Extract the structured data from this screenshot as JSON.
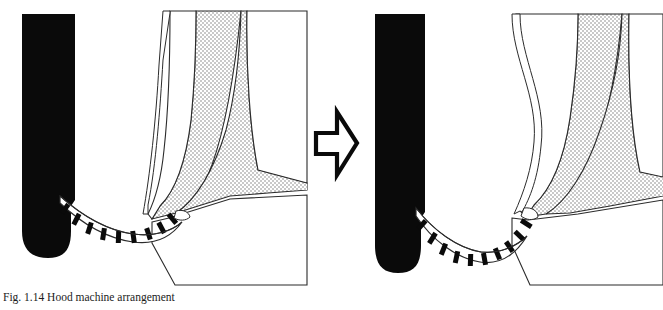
{
  "figure": {
    "caption": "Fig. 1.14 Hood machine arrangement",
    "panels": [
      {
        "id": "before",
        "name": "left-panel",
        "label": "",
        "roll_name": "suction-roll",
        "roll_color": "#0a0a0a",
        "felt_name": "forming-fabric-belt",
        "stipple_name": "stippled-nozzle-region"
      },
      {
        "id": "after",
        "name": "right-panel",
        "label": "",
        "roll_name": "suction-roll",
        "roll_color": "#0a0a0a",
        "felt_name": "forming-fabric-belt",
        "stipple_name": "stippled-nozzle-region"
      }
    ],
    "transition_arrow": {
      "name": "transition-arrow",
      "direction": "right",
      "label": ""
    },
    "colors": {
      "line": "#2b2b2b",
      "fill_solid": "#0a0a0a",
      "fill_stipple": "#d8d8d8",
      "background": "#ffffff"
    }
  }
}
